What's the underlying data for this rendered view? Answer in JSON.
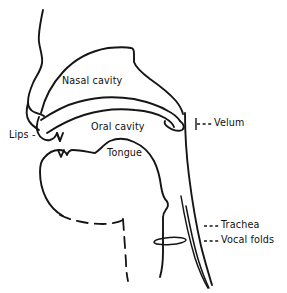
{
  "diagram": {
    "stroke_color": "#151515",
    "background_color": "#ffffff",
    "labels": {
      "nasal_cavity": "Nasal cavity",
      "oral_cavity": "Oral cavity",
      "tongue": "Tongue",
      "lips": "Lips -",
      "velum": "Velum",
      "trachea": "Trachea",
      "vocal_folds": "Vocal folds"
    }
  }
}
